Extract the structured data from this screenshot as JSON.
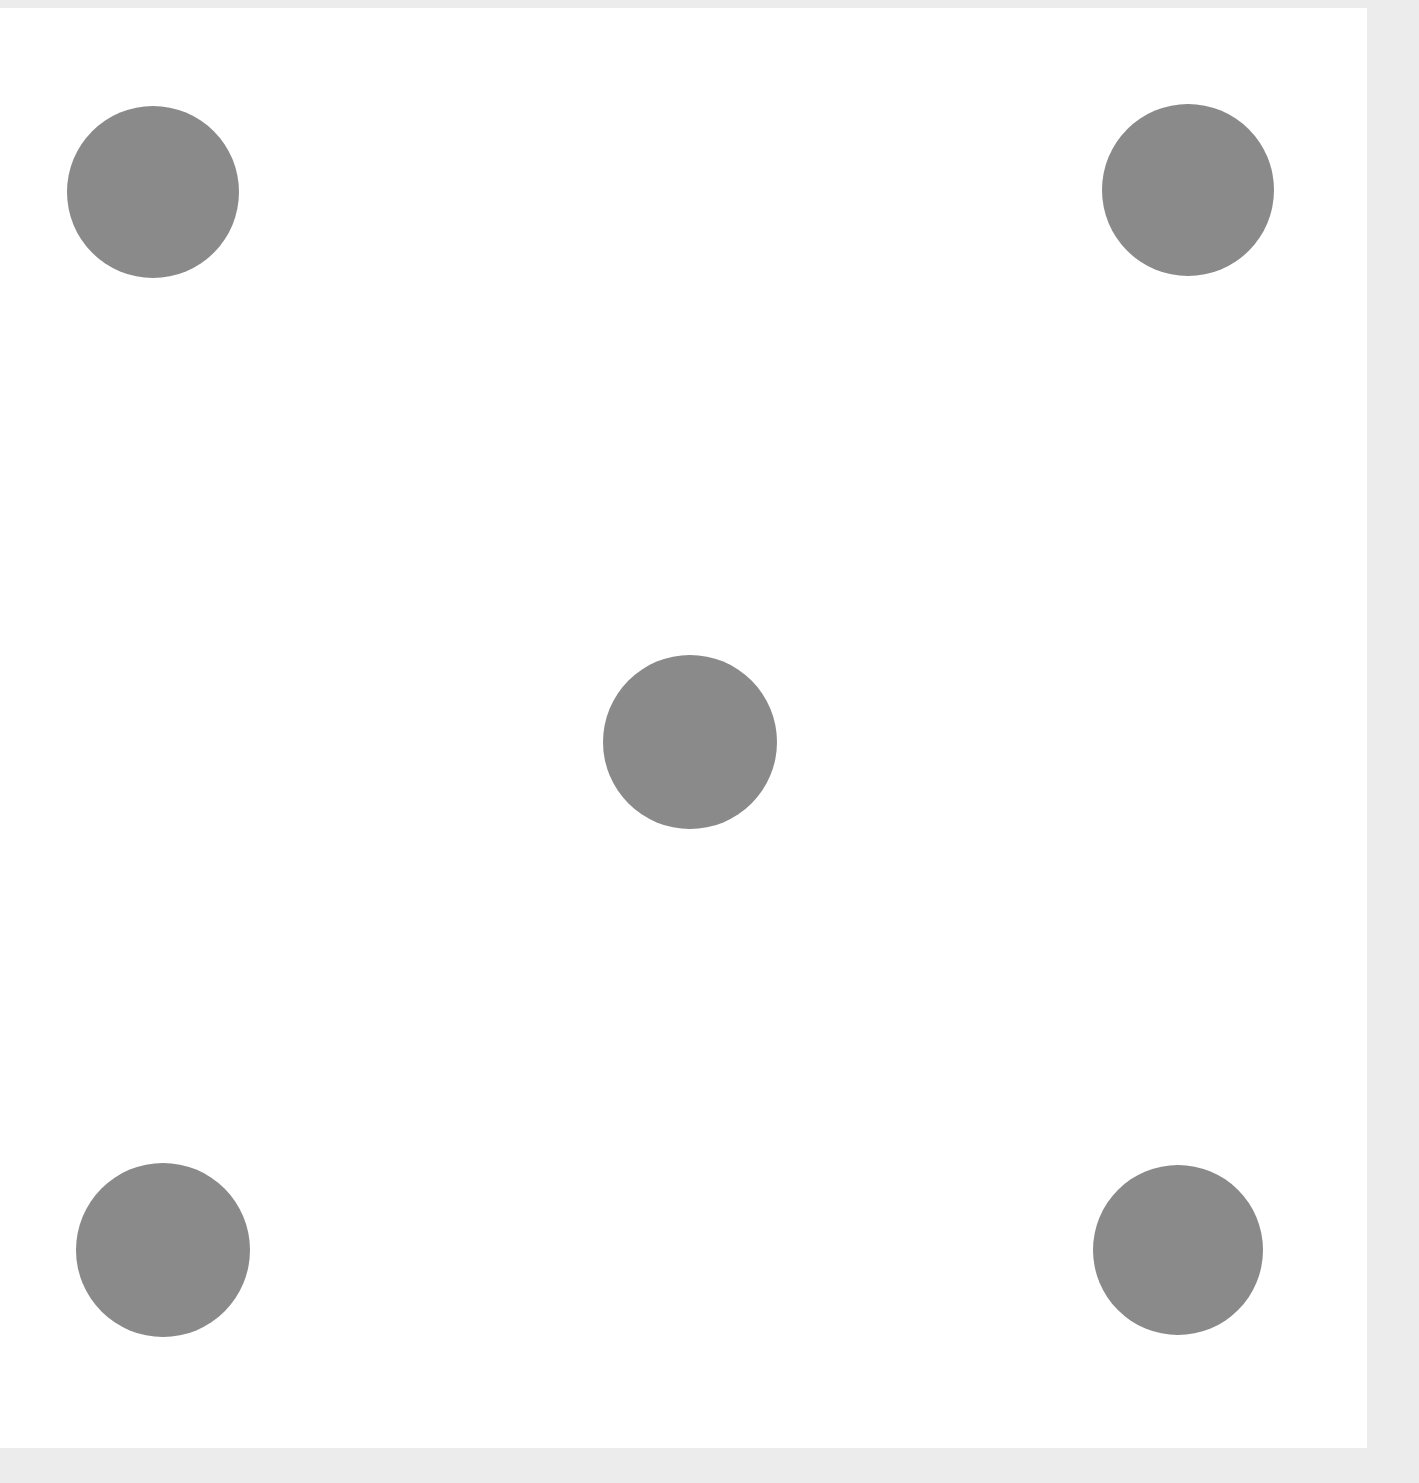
{
  "image": {
    "description": "Dice face showing five",
    "face_value": 5,
    "background_color": "#ffffff",
    "border_color": "#ececec",
    "pip_color": "#8a8a8a",
    "pips": [
      {
        "name": "top-left",
        "cx": 153,
        "cy": 192,
        "r": 86
      },
      {
        "name": "top-right",
        "cx": 1188,
        "cy": 190,
        "r": 86
      },
      {
        "name": "center",
        "cx": 690,
        "cy": 742,
        "r": 87
      },
      {
        "name": "bottom-left",
        "cx": 163,
        "cy": 1250,
        "r": 87
      },
      {
        "name": "bottom-right",
        "cx": 1178,
        "cy": 1250,
        "r": 85
      }
    ]
  }
}
